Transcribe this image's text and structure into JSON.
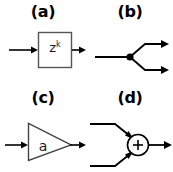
{
  "figure": {
    "width": 173,
    "height": 172,
    "background": "#ffffff",
    "stroke_color": "#000000",
    "box_stroke_color": "#555555",
    "text_color": "#1a1a1a"
  },
  "panels": [
    {
      "key": "a",
      "label": "(a)",
      "element": "delay-block",
      "shape": "rectangle",
      "block_text": "z",
      "block_superscript": "k",
      "inputs": 1,
      "outputs": 1
    },
    {
      "key": "b",
      "label": "(b)",
      "element": "branch-node",
      "shape": "node-dot",
      "block_text": "",
      "block_superscript": "",
      "inputs": 1,
      "outputs": 2
    },
    {
      "key": "c",
      "label": "(c)",
      "element": "gain-block",
      "shape": "triangle",
      "block_text": "a",
      "block_superscript": "",
      "inputs": 1,
      "outputs": 1
    },
    {
      "key": "d",
      "label": "(d)",
      "element": "summing-junction",
      "shape": "circle",
      "block_text": "+",
      "block_superscript": "",
      "inputs": 2,
      "outputs": 1
    }
  ]
}
